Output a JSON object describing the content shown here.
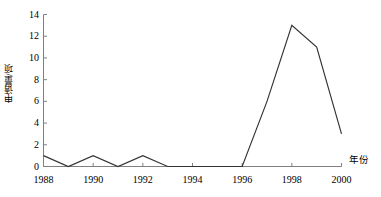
{
  "chart_data": {
    "type": "line",
    "title": "",
    "subtitle": "",
    "xlabel": "年份",
    "ylabel": "申请量/项",
    "x": [
      1988,
      1989,
      1990,
      1991,
      1992,
      1993,
      1994,
      1995,
      1996,
      1997,
      1998,
      1999,
      2000
    ],
    "values": [
      1,
      0,
      1,
      0,
      1,
      0,
      0,
      0,
      0,
      6,
      13,
      11,
      3
    ],
    "series": [
      {
        "name": "申请量",
        "values": [
          1,
          0,
          1,
          0,
          1,
          0,
          0,
          0,
          0,
          6,
          13,
          11,
          3
        ]
      }
    ],
    "xlim": [
      1988,
      2000
    ],
    "ylim": [
      0,
      14
    ],
    "xticks": [
      1988,
      1990,
      1992,
      1994,
      1996,
      1998,
      2000
    ],
    "xtick_labels": [
      "1988",
      "1990",
      "1992",
      "1994",
      "1996",
      "1998",
      "2000"
    ],
    "yticks": [
      0,
      2,
      4,
      6,
      8,
      10,
      12,
      14
    ],
    "ytick_labels": [
      "0",
      "2",
      "4",
      "6",
      "8",
      "10",
      "12",
      "14"
    ],
    "grid": false,
    "legend": "none",
    "line_color": "#333333",
    "axis_color": "#808080",
    "annotations": []
  }
}
